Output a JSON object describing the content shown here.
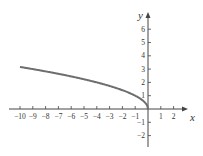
{
  "chart_data": {
    "type": "line",
    "title": "",
    "xlabel": "x",
    "ylabel": "y",
    "xlim": [
      -10.5,
      3
    ],
    "ylim": [
      -2.8,
      7.2
    ],
    "x_ticks": [
      -10,
      -9,
      -8,
      -7,
      -6,
      -5,
      -4,
      -3,
      -2,
      -1,
      1,
      2
    ],
    "x_tick_labels": [
      "−10",
      "−9",
      "−8",
      "−7",
      "−6",
      "−5",
      "−4",
      "−3",
      "−2",
      "−1",
      "1",
      "2"
    ],
    "y_ticks": [
      -2,
      -1,
      1,
      2,
      3,
      4,
      5,
      6
    ],
    "y_tick_labels": [
      "−2",
      "−1",
      "1",
      "2",
      "3",
      "4",
      "5",
      "6"
    ],
    "grid": false,
    "legend": null,
    "series": [
      {
        "name": "y = sqrt(-x)",
        "x": [
          -10,
          -9,
          -8,
          -7,
          -6,
          -5,
          -4,
          -3,
          -2,
          -1,
          -0.5,
          -0.1,
          0
        ],
        "y": [
          3.16,
          3.0,
          2.83,
          2.65,
          2.45,
          2.24,
          2.0,
          1.73,
          1.41,
          1.0,
          0.71,
          0.32,
          0
        ],
        "color": "#6e6e6e"
      }
    ]
  },
  "colors": {
    "axis": "#444444",
    "curve": "#6e6e6e",
    "text": "#333333"
  }
}
